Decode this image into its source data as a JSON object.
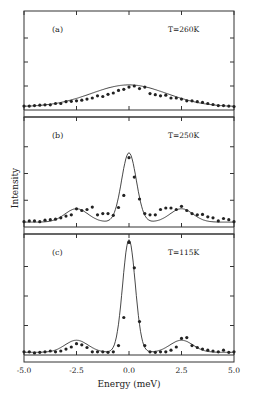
{
  "chart_data": {
    "type": "scatter",
    "title": "",
    "xlabel": "Energy (meV)",
    "ylabel": "Intensity",
    "xlim": [
      -5.0,
      5.0
    ],
    "xticks": [
      -5.0,
      -2.5,
      0.0,
      2.5,
      5.0
    ],
    "xtick_labels": [
      "-5.0",
      "-2.5",
      "0.0",
      "2.5",
      "5.0"
    ],
    "grid": false,
    "legend": null,
    "panels": [
      {
        "label": "(a)",
        "temperature": "T=260K",
        "ylim": [
          0,
          4
        ],
        "description": "Broad quasi-elastic peak centered at 0 meV, no side peaks",
        "fit": {
          "center": 0.0,
          "amplitude": 1.0,
          "width": 1.8,
          "baseline": 0.15
        },
        "series": [
          {
            "name": "data",
            "x": [
              -5.0,
              -4.75,
              -4.5,
              -4.25,
              -4.0,
              -3.75,
              -3.5,
              -3.25,
              -3.0,
              -2.75,
              -2.5,
              -2.25,
              -2.0,
              -1.75,
              -1.5,
              -1.25,
              -1.0,
              -0.75,
              -0.5,
              -0.25,
              0.0,
              0.25,
              0.5,
              0.75,
              1.0,
              1.25,
              1.5,
              1.75,
              2.0,
              2.25,
              2.5,
              2.75,
              3.0,
              3.25,
              3.5,
              3.75,
              4.0,
              4.25,
              4.5,
              4.75,
              5.0
            ],
            "y": [
              0.18,
              0.18,
              0.2,
              0.22,
              0.24,
              0.24,
              0.3,
              0.3,
              0.38,
              0.4,
              0.42,
              0.45,
              0.5,
              0.55,
              0.65,
              0.62,
              0.72,
              0.78,
              0.9,
              0.95,
              1.05,
              1.1,
              0.98,
              1.05,
              0.75,
              0.7,
              0.65,
              0.68,
              0.55,
              0.55,
              0.5,
              0.42,
              0.42,
              0.38,
              0.35,
              0.3,
              0.25,
              0.2,
              0.2,
              0.18,
              0.16
            ]
          }
        ]
      },
      {
        "label": "(b)",
        "temperature": "T=250K",
        "ylim": [
          0,
          4
        ],
        "description": "Central peak at 0 meV with weak side peaks near ±2.5 meV",
        "fit": {
          "center": 0.0,
          "amplitude": 2.85,
          "width": 0.35,
          "side_peaks": [
            -2.5,
            2.5
          ],
          "side_amplitude": 0.55,
          "baseline": 0.2
        },
        "series": [
          {
            "name": "data",
            "x": [
              -5.0,
              -4.75,
              -4.5,
              -4.25,
              -4.0,
              -3.75,
              -3.5,
              -3.25,
              -3.0,
              -2.75,
              -2.5,
              -2.25,
              -2.0,
              -1.75,
              -1.5,
              -1.25,
              -1.0,
              -0.75,
              -0.5,
              -0.25,
              0.0,
              0.25,
              0.5,
              0.75,
              1.0,
              1.25,
              1.5,
              1.75,
              2.0,
              2.25,
              2.5,
              2.75,
              3.0,
              3.25,
              3.5,
              3.75,
              4.0,
              4.25,
              4.5,
              4.75,
              5.0
            ],
            "y": [
              0.22,
              0.25,
              0.25,
              0.22,
              0.28,
              0.3,
              0.32,
              0.38,
              0.45,
              0.5,
              0.75,
              0.68,
              0.72,
              0.82,
              0.5,
              0.55,
              0.55,
              0.48,
              0.8,
              1.3,
              2.85,
              2.05,
              1.15,
              0.55,
              0.5,
              0.5,
              0.72,
              0.78,
              0.78,
              0.72,
              0.85,
              0.68,
              0.55,
              0.5,
              0.52,
              0.42,
              0.38,
              0.25,
              0.35,
              0.3,
              0.22
            ]
          }
        ]
      },
      {
        "label": "(c)",
        "temperature": "T=115K",
        "ylim": [
          0,
          4
        ],
        "description": "Strong narrow central peak at 0 meV with distinct side peaks at ±2.5 meV",
        "fit": {
          "center": 0.0,
          "amplitude": 4.2,
          "width": 0.3,
          "side_peaks": [
            -2.5,
            2.5
          ],
          "side_amplitude": 0.45,
          "baseline": 0.1
        },
        "series": [
          {
            "name": "data",
            "x": [
              -5.0,
              -4.75,
              -4.5,
              -4.25,
              -4.0,
              -3.75,
              -3.5,
              -3.25,
              -3.0,
              -2.75,
              -2.5,
              -2.25,
              -2.0,
              -1.75,
              -1.5,
              -1.25,
              -1.0,
              -0.75,
              -0.5,
              -0.25,
              0.0,
              0.25,
              0.5,
              0.75,
              1.0,
              1.25,
              1.5,
              1.75,
              2.0,
              2.25,
              2.5,
              2.75,
              3.0,
              3.25,
              3.5,
              3.75,
              4.0,
              4.25,
              4.5,
              4.75,
              5.0
            ],
            "y": [
              0.12,
              0.12,
              0.08,
              0.1,
              0.12,
              0.15,
              0.12,
              0.15,
              0.22,
              0.3,
              0.42,
              0.38,
              0.28,
              0.12,
              0.12,
              0.12,
              0.1,
              0.12,
              0.35,
              1.4,
              4.2,
              3.25,
              1.25,
              0.35,
              0.12,
              0.1,
              0.12,
              0.12,
              0.18,
              0.3,
              0.62,
              0.65,
              0.35,
              0.28,
              0.22,
              0.18,
              0.15,
              0.12,
              0.18,
              0.1,
              0.12
            ]
          }
        ]
      }
    ]
  }
}
